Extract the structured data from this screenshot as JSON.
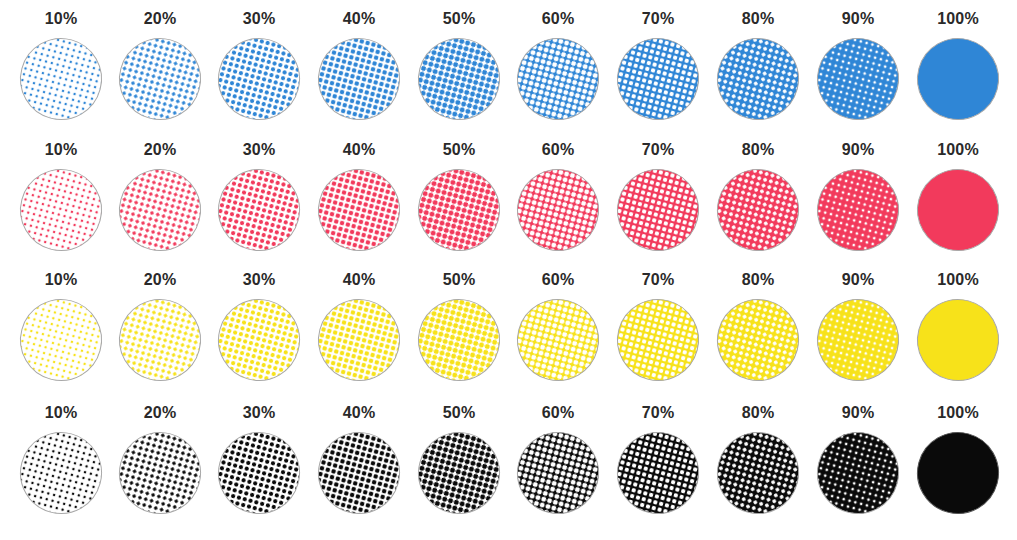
{
  "figure": {
    "caption": ""
  },
  "chart_data": {
    "type": "table",
    "columns": [
      "10%",
      "20%",
      "30%",
      "40%",
      "50%",
      "60%",
      "70%",
      "80%",
      "90%",
      "100%"
    ],
    "tint_values": [
      10,
      20,
      30,
      40,
      50,
      60,
      70,
      80,
      90,
      100
    ],
    "rows": [
      {
        "name": "Cyan",
        "color": "#2f86d6"
      },
      {
        "name": "Magenta",
        "color": "#f23a5c"
      },
      {
        "name": "Yellow",
        "color": "#f7e21a"
      },
      {
        "name": "Black",
        "color": "#0a0a0a"
      }
    ]
  },
  "rows": [
    {
      "ink": "cyan",
      "color": "#2f86d6",
      "labels": [
        "10%",
        "20%",
        "30%",
        "40%",
        "50%",
        "60%",
        "70%",
        "80%",
        "90%",
        "100%"
      ]
    },
    {
      "ink": "magenta",
      "color": "#f23a5c",
      "labels": [
        "10%",
        "20%",
        "30%",
        "40%",
        "50%",
        "60%",
        "70%",
        "80%",
        "90%",
        "100%"
      ]
    },
    {
      "ink": "yellow",
      "color": "#f7e21a",
      "labels": [
        "10%",
        "20%",
        "30%",
        "40%",
        "50%",
        "60%",
        "70%",
        "80%",
        "90%",
        "100%"
      ]
    },
    {
      "ink": "black",
      "color": "#0a0a0a",
      "labels": [
        "10%",
        "20%",
        "30%",
        "40%",
        "50%",
        "60%",
        "70%",
        "80%",
        "90%",
        "100%"
      ]
    }
  ]
}
